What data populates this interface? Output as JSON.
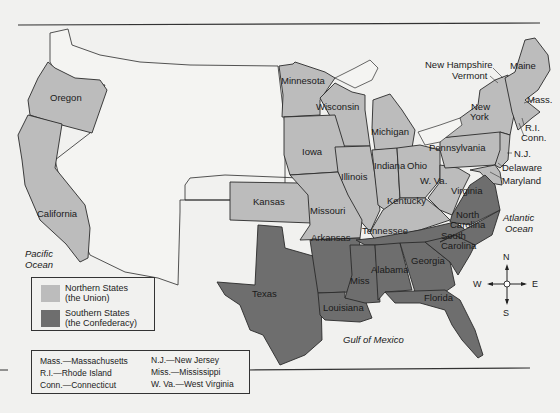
{
  "colors": {
    "union": "#bcbcbc",
    "confederacy": "#6e6e6e",
    "territory": "#f4f4f2",
    "background": "#f1f1ef",
    "border": "#2a2a2a"
  },
  "states": {
    "union": [
      "Oregon",
      "California",
      "Kansas",
      "Minnesota",
      "Wisconsin",
      "Michigan",
      "Iowa",
      "Illinois",
      "Indiana",
      "Ohio",
      "Missouri",
      "Kentucky",
      "W. Va.",
      "Pennsylvania",
      "New York",
      "New Hampshire",
      "Vermont",
      "Maine",
      "Mass.",
      "R.I.",
      "Conn.",
      "N.J.",
      "Delaware",
      "Maryland"
    ],
    "confederacy": [
      "Texas",
      "Arkansas",
      "Louisiana",
      "Tennessee",
      "Miss",
      "Alabama",
      "Georgia",
      "Florida",
      "South Carolina",
      "North Carolina",
      "Virginia"
    ]
  },
  "labels": {
    "oregon": "Oregon",
    "california": "California",
    "kansas": "Kansas",
    "minnesota": "Minnesota",
    "wisconsin": "Wisconsin",
    "michigan": "Michigan",
    "iowa": "Iowa",
    "illinois": "Illinois",
    "indiana": "Indiana",
    "ohio": "Ohio",
    "missouri": "Missouri",
    "kentucky": "Kentucky",
    "wva": "W. Va.",
    "pennsylvania": "Pennsylvania",
    "new_york_1": "New",
    "new_york_2": "York",
    "new_hampshire": "New Hampshire",
    "vermont": "Vermont",
    "maine": "Maine",
    "mass": "Mass.",
    "ri": "R.I.",
    "conn": "Conn.",
    "nj": "N.J.",
    "delaware": "Delaware",
    "maryland": "Maryland",
    "virginia": "Virginia",
    "nc_1": "North",
    "nc_2": "Carolina",
    "sc_1": "South",
    "sc_2": "Carolina",
    "tennessee": "Tennessee",
    "arkansas": "Arkansas",
    "texas": "Texas",
    "louisiana": "Louisiana",
    "miss": "Miss",
    "alabama": "Alabama",
    "georgia": "Georgia",
    "florida": "Florida"
  },
  "water": {
    "pacific_1": "Pacific",
    "pacific_2": "Ocean",
    "atlantic_1": "Atlantic",
    "atlantic_2": "Ocean",
    "gulf": "Gulf of Mexico"
  },
  "legend": {
    "union_1": "Northern States",
    "union_2": "(the Union)",
    "conf_1": "Southern States",
    "conf_2": "(the Confederacy)"
  },
  "abbreviations": [
    {
      "abbr": "Mass.—Massachusetts"
    },
    {
      "abbr": "R.I.—Rhode Island"
    },
    {
      "abbr": "Conn.—Connecticut"
    },
    {
      "abbr": "N.J.—New Jersey"
    },
    {
      "abbr": "Miss.—Mississippi"
    },
    {
      "abbr": "W. Va.—West Virginia"
    }
  ],
  "compass": {
    "n": "N",
    "s": "S",
    "e": "E",
    "w": "W"
  }
}
